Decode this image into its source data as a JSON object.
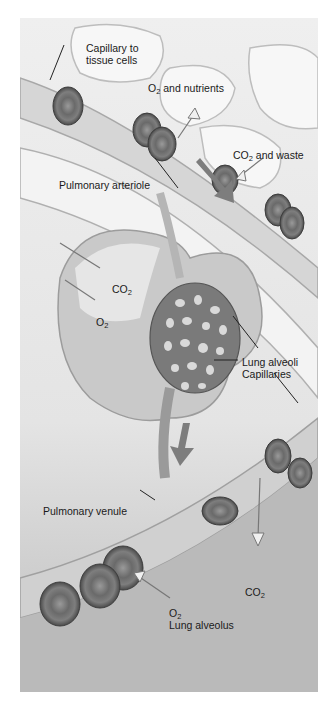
{
  "figure": {
    "colors": {
      "background": "#ffffff",
      "tissue": "#e9e9e9",
      "vessel": "#cfcfcf",
      "rbc": "#6f6f6f",
      "arrow": "#8a8a8a",
      "text": "#1a1a1a"
    },
    "labels": {
      "capillary_to_tissue_1": "Capillary to",
      "capillary_to_tissue_2": "tissue cells",
      "o2_nutrients_pre": "O",
      "o2_nutrients_sub": "2",
      "o2_nutrients_post": " and nutrients",
      "co2_waste_pre": "CO",
      "co2_waste_sub": "2",
      "co2_waste_post": " and waste",
      "pulmonary_arteriole": "Pulmonary arteriole",
      "co2_alveolus_pre": "CO",
      "co2_alveolus_sub": "2",
      "o2_alveolus_pre": "O",
      "o2_alveolus_sub": "2",
      "lung_alveoli": "Lung alveoli",
      "capillaries": "Capillaries",
      "pulmonary_venule": "Pulmonary venule",
      "co2_bottom_pre": "CO",
      "co2_bottom_sub": "2",
      "o2_bottom_pre": "O",
      "o2_bottom_sub": "2",
      "lung_alveolus": "Lung alveolus"
    }
  }
}
